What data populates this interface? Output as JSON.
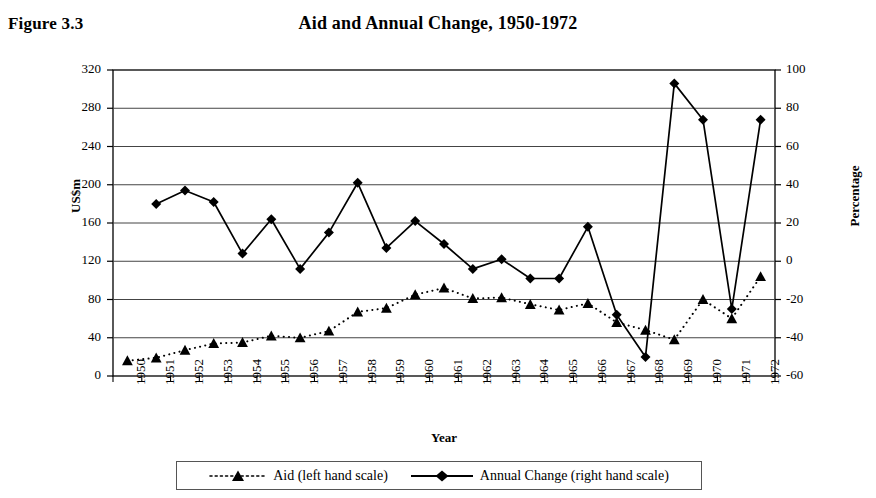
{
  "figure": {
    "label": "Figure 3.3",
    "title": "Aid and Annual Change, 1950-1972",
    "year_axis_label": "Year",
    "left_axis_label": "US$m",
    "right_axis_label": "Percentage"
  },
  "legend": {
    "position": "bottom-center",
    "entries": [
      {
        "label": "Aid (left hand scale)",
        "marker": "triangle-marker",
        "line": "dotted",
        "color": "#000000"
      },
      {
        "label": "Annual Change (right hand scale)",
        "marker": "diamond-marker",
        "line": "solid",
        "color": "#000000"
      }
    ]
  },
  "chart_data": {
    "type": "line",
    "title": "Aid and Annual Change, 1950-1972",
    "subtitle": "Figure 3.3",
    "xlabel": "Year",
    "ylabel": "US$m",
    "y2label": "Percentage",
    "grid": true,
    "legend_position": "bottom",
    "categories": [
      "1950",
      "1951",
      "1952",
      "1953",
      "1954",
      "1955",
      "1956",
      "1957",
      "1958",
      "1959",
      "1960",
      "1961",
      "1962",
      "1963",
      "1964",
      "1965",
      "1966",
      "1967",
      "1968",
      "1969",
      "1970",
      "1971",
      "1972"
    ],
    "yticks": [
      0,
      40,
      80,
      120,
      160,
      200,
      240,
      280,
      320
    ],
    "ylim": [
      0,
      320
    ],
    "y2ticks": [
      -60,
      -40,
      -20,
      0,
      20,
      40,
      60,
      80,
      100
    ],
    "y2lim": [
      -60,
      100
    ],
    "series": [
      {
        "name": "Aid (left hand scale)",
        "axis": "left",
        "marker": "triangle",
        "line": "dotted",
        "values": [
          16,
          19,
          27,
          34,
          35,
          42,
          40,
          47,
          67,
          71,
          85,
          92,
          81,
          82,
          75,
          69,
          76,
          56,
          48,
          38,
          80,
          60,
          104
        ]
      },
      {
        "name": "Annual Change (right hand scale)",
        "axis": "right",
        "marker": "diamond",
        "line": "solid",
        "values": [
          null,
          30,
          37,
          31,
          4,
          22,
          -4,
          15,
          41,
          7,
          21,
          9,
          -4,
          1,
          -9,
          -9,
          18,
          -28,
          -50,
          93,
          74,
          -25,
          74
        ]
      }
    ]
  }
}
